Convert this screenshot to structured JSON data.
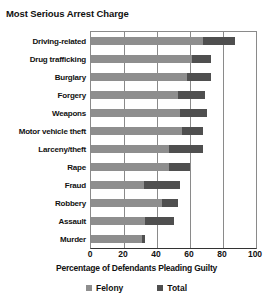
{
  "chart_data": {
    "type": "bar",
    "orientation": "horizontal",
    "stacked_overlay": true,
    "title": "Most Serious Arrest Charge",
    "xlabel": "Percentage of Defendants Pleading Guilty",
    "ylabel": "",
    "xlim": [
      0,
      100
    ],
    "xticks": [
      0,
      20,
      40,
      60,
      80,
      100
    ],
    "xtick_labels": [
      "0",
      "20",
      "40",
      "60",
      "80",
      "100"
    ],
    "grid": "vertical",
    "legend_position": "bottom",
    "categories": [
      "Driving-related",
      "Drug trafficking",
      "Burglary",
      "Forgery",
      "Weapons",
      "Motor vehicle theft",
      "Larceny/theft",
      "Rape",
      "Fraud",
      "Robbery",
      "Assault",
      "Murder"
    ],
    "series": [
      {
        "name": "Felony",
        "color": "#8e8e8e",
        "values": [
          68,
          61,
          58,
          53,
          54,
          55,
          47,
          47,
          32,
          43,
          33,
          31
        ]
      },
      {
        "name": "Total",
        "color": "#4f4f4f",
        "values": [
          87,
          73,
          73,
          69,
          70,
          68,
          68,
          60,
          54,
          53,
          50,
          33
        ]
      }
    ]
  },
  "legend": {
    "entries": [
      {
        "label": "Felony",
        "color": "#8e8e8e"
      },
      {
        "label": "Total",
        "color": "#4f4f4f"
      }
    ]
  },
  "colors": {
    "felony": "#8e8e8e",
    "total": "#4f4f4f",
    "axis": "#333333",
    "grid": "#8a8a8a",
    "text": "#111111",
    "background": "#ffffff"
  }
}
